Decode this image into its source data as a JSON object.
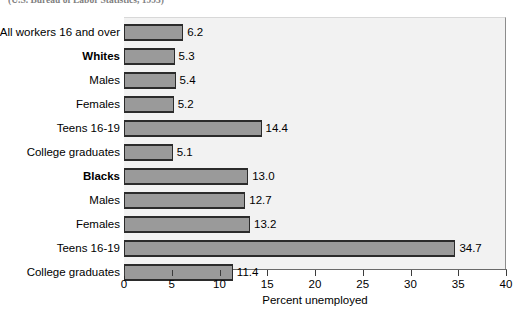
{
  "source_note": "(U.S. Bureau of Labor Statistics, 1993)",
  "chart_data": {
    "type": "bar",
    "orientation": "horizontal",
    "title": "",
    "subtitle": "(U.S. Bureau of Labor Statistics, 1993)",
    "xlabel": "Percent unemployed",
    "ylabel": "",
    "xlim": [
      0,
      40
    ],
    "xticks": [
      0,
      5,
      10,
      15,
      20,
      25,
      30,
      35,
      40
    ],
    "xtick_labels": [
      "0",
      "5",
      "10",
      "15",
      "20",
      "25",
      "30",
      "35",
      "40"
    ],
    "grid": false,
    "legend": "none",
    "bar_color": "#9a9a9a",
    "bar_edge_color": "#2b2b2b",
    "plot_background": "#f2f2f2",
    "categories": [
      "All workers 16 and over",
      "Whites",
      "Males",
      "Females",
      "Teens 16-19",
      "College graduates",
      "Blacks",
      "Males",
      "Females",
      "Teens 16-19",
      "College graduates"
    ],
    "values": [
      6.2,
      5.3,
      5.4,
      5.2,
      14.4,
      5.1,
      13.0,
      12.7,
      13.2,
      34.7,
      11.4
    ],
    "value_labels": [
      "6.2",
      "5.3",
      "5.4",
      "5.2",
      "14.4",
      "5.1",
      "13.0",
      "12.7",
      "13.2",
      "34.7",
      "11.4"
    ],
    "bold_categories": [
      "Whites",
      "Blacks"
    ],
    "bars": [
      {
        "label": "All workers 16 and over",
        "value": 6.2,
        "value_label": "6.2",
        "bold": false
      },
      {
        "label": "Whites",
        "value": 5.3,
        "value_label": "5.3",
        "bold": true
      },
      {
        "label": "Males",
        "value": 5.4,
        "value_label": "5.4",
        "bold": false
      },
      {
        "label": "Females",
        "value": 5.2,
        "value_label": "5.2",
        "bold": false
      },
      {
        "label": "Teens 16-19",
        "value": 14.4,
        "value_label": "14.4",
        "bold": false
      },
      {
        "label": "College graduates",
        "value": 5.1,
        "value_label": "5.1",
        "bold": false
      },
      {
        "label": "Blacks",
        "value": 13.0,
        "value_label": "13.0",
        "bold": true
      },
      {
        "label": "Males",
        "value": 12.7,
        "value_label": "12.7",
        "bold": false
      },
      {
        "label": "Females",
        "value": 13.2,
        "value_label": "13.2",
        "bold": false
      },
      {
        "label": "Teens 16-19",
        "value": 34.7,
        "value_label": "34.7",
        "bold": false
      },
      {
        "label": "College graduates",
        "value": 11.4,
        "value_label": "11.4",
        "bold": false
      }
    ]
  }
}
